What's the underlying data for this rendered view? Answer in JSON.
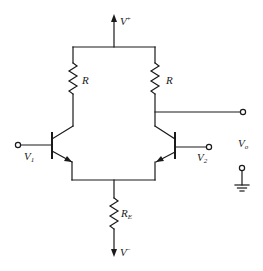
{
  "diagram": {
    "type": "circuit-schematic",
    "colors": {
      "line": "#1a1a1a",
      "background": "#ffffff"
    },
    "labels": {
      "vplus": {
        "main": "V",
        "sup": "+"
      },
      "vminus": {
        "main": "V",
        "sup": "−"
      },
      "r_left": "R",
      "r_right": "R",
      "re": {
        "main": "R",
        "sub": "E"
      },
      "v1": {
        "main": "V",
        "sub": "1"
      },
      "v2": {
        "main": "V",
        "sub": "2"
      },
      "vo": {
        "main": "V",
        "sub": "o"
      }
    },
    "components": [
      {
        "id": "R1",
        "type": "resistor",
        "label": "R"
      },
      {
        "id": "R2",
        "type": "resistor",
        "label": "R"
      },
      {
        "id": "RE",
        "type": "resistor",
        "label": "R_E"
      },
      {
        "id": "Q1",
        "type": "npn-transistor",
        "input": "V_1"
      },
      {
        "id": "Q2",
        "type": "npn-transistor",
        "input": "V_2"
      },
      {
        "id": "GND",
        "type": "ground"
      }
    ],
    "terminals": [
      "V+",
      "V-",
      "V_1",
      "V_2",
      "V_o"
    ]
  }
}
